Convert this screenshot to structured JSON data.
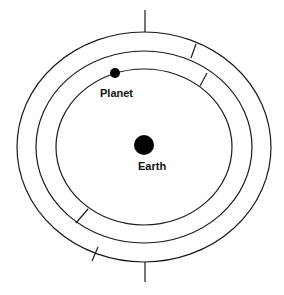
{
  "diagram": {
    "title": "",
    "colors": {
      "line": "#1a1a1a",
      "background": "#ffffff",
      "body": "#000000"
    },
    "center": {
      "x": 144,
      "y": 147
    },
    "rings": [
      {
        "name": "outer-orbit",
        "rx": 127,
        "ry": 115
      },
      {
        "name": "middle-orbit",
        "rx": 108,
        "ry": 96
      },
      {
        "name": "inner-orbit",
        "rx": 88,
        "ry": 78
      }
    ],
    "ticks": [
      {
        "name": "top-tick",
        "x1": 145,
        "y1": 10,
        "x2": 145,
        "y2": 32
      },
      {
        "name": "bottom-tick",
        "x1": 145,
        "y1": 262,
        "x2": 145,
        "y2": 282
      }
    ],
    "dividers": [
      {
        "name": "outer-band-divider-upper-right",
        "x1": 196,
        "y1": 44,
        "x2": 191,
        "y2": 58
      },
      {
        "name": "inner-band-divider-upper-right",
        "x1": 207,
        "y1": 73,
        "x2": 200,
        "y2": 86
      },
      {
        "name": "inner-band-divider-lower-left",
        "x1": 88,
        "y1": 209,
        "x2": 76,
        "y2": 223
      },
      {
        "name": "outer-band-divider-lower-left",
        "x1": 98,
        "y1": 247,
        "x2": 92,
        "y2": 261
      }
    ],
    "bodies": {
      "planet": {
        "label": "Planet",
        "cx": 115,
        "cy": 73,
        "r": 5,
        "label_x": 100,
        "label_y": 97
      },
      "earth": {
        "label": "Earth",
        "cx": 144,
        "cy": 145,
        "r": 10,
        "label_x": 138,
        "label_y": 170
      }
    }
  }
}
